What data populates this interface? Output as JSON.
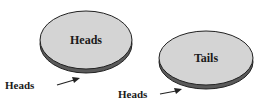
{
  "diagram": {
    "coins": [
      {
        "top_face_label": "Heads",
        "bottom_side_label": "Heads"
      },
      {
        "top_face_label": "Tails",
        "bottom_side_label": "Heads"
      }
    ],
    "colors": {
      "face": "#d4d4d4",
      "edge": "#5a5a5a",
      "outline": "#222222",
      "text": "#1a1a1a"
    }
  }
}
